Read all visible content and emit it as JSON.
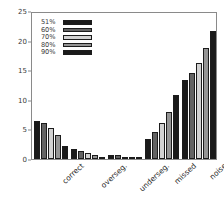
{
  "chart_data": {
    "type": "bar",
    "title": "",
    "xlabel": "",
    "ylabel": "",
    "ylim": [
      0,
      25
    ],
    "yticks": [
      0,
      5,
      10,
      15,
      20,
      25
    ],
    "ytick_labels": [
      "0",
      "5",
      "10",
      "15",
      "20",
      "25"
    ],
    "grid": false,
    "legend_position": "upper left (inside axes)",
    "categories": [
      "correct",
      "overseg.",
      "underseg.",
      "missed",
      "noise"
    ],
    "series": [
      {
        "name": "51%",
        "color": "#1a1a1a",
        "values": [
          6.5,
          1.7,
          0.7,
          3.3,
          13.3
        ]
      },
      {
        "name": "60%",
        "color": "#636363",
        "values": [
          6.1,
          1.4,
          0.6,
          4.5,
          14.5
        ]
      },
      {
        "name": "70%",
        "color": "#d2d2d2",
        "values": [
          5.2,
          1.0,
          0.4,
          6.0,
          16.3
        ]
      },
      {
        "name": "80%",
        "color": "#959595",
        "values": [
          4.1,
          0.6,
          0.2,
          8.0,
          18.7
        ]
      },
      {
        "name": "90%",
        "color": "#1a1a1a",
        "values": [
          2.2,
          0.3,
          0.1,
          10.8,
          21.7
        ]
      }
    ]
  },
  "axes": {
    "frame_color": "#8a8a8a",
    "tick_label_color": "#3a3a3a"
  },
  "legend": {
    "entries": [
      {
        "label": "51%",
        "color": "#1a1a1a"
      },
      {
        "label": "60%",
        "color": "#636363"
      },
      {
        "label": "70%",
        "color": "#d2d2d2"
      },
      {
        "label": "80%",
        "color": "#959595"
      },
      {
        "label": "90%",
        "color": "#1a1a1a"
      }
    ]
  }
}
